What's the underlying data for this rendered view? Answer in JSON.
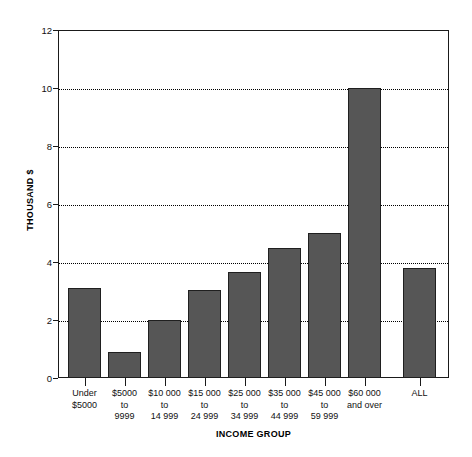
{
  "chart_data": {
    "type": "bar",
    "title": "",
    "xlabel": "INCOME GROUP",
    "ylabel": "THOUSAND $",
    "ylim": [
      0,
      12
    ],
    "ytick_values": [
      0,
      2,
      4,
      6,
      8,
      10,
      12
    ],
    "ytick_labels": [
      "0",
      "2",
      "4",
      "6",
      "8",
      "10",
      "12"
    ],
    "grid": "horizontal-dotted",
    "legend": "none",
    "bar_color": "#565656",
    "bar_edge_color": "#1f1f1f",
    "axis_color": "#1a1a1a",
    "categories": [
      "Under $5000",
      "$5000 to 9999",
      "$10 000 to 14 999",
      "$15 000 to 24 999",
      "$25 000 to 34 999",
      "$35 000 to 44 999",
      "$45 000 to 59 999",
      "$60 000 and over",
      "ALL"
    ],
    "category_lines": [
      [
        "Under",
        "$5000"
      ],
      [
        "$5000",
        "to",
        "9999"
      ],
      [
        "$10 000",
        "to",
        "14 999"
      ],
      [
        "$15 000",
        "to",
        "24 999"
      ],
      [
        "$25 000",
        "to",
        "34 999"
      ],
      [
        "$35 000",
        "to",
        "44 999"
      ],
      [
        "$45 000",
        "to",
        "59 999"
      ],
      [
        "$60 000",
        "and over"
      ],
      [
        "ALL"
      ]
    ],
    "values": [
      3.1,
      0.9,
      2.0,
      3.05,
      3.65,
      4.5,
      5.0,
      10.0,
      3.8
    ]
  }
}
